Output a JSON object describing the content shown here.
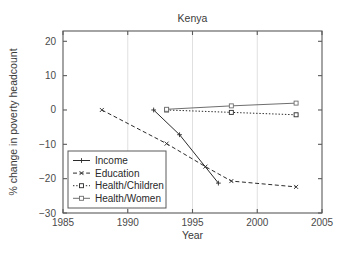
{
  "chart_data": {
    "type": "line",
    "title": "Kenya",
    "xlabel": "Year",
    "ylabel": "% change in poverty headcount",
    "xlim": [
      1985,
      2005
    ],
    "ylim": [
      -30,
      23
    ],
    "xticks": [
      1985,
      1990,
      1995,
      2000,
      2005
    ],
    "yticks": [
      20,
      10,
      0,
      -10,
      -20,
      -30
    ],
    "xtick_labels": [
      "1985",
      "1990",
      "1995",
      "2000",
      "2005"
    ],
    "ytick_labels": [
      "20",
      "10",
      "0",
      "-10",
      "-20",
      "-30"
    ],
    "grid": true,
    "grid_axis": "x",
    "legend_position": "lower left",
    "series": [
      {
        "name": "Income",
        "linestyle": "solid",
        "color": "#2b2b2b",
        "marker": "plus",
        "x": [
          1992,
          1994,
          1997
        ],
        "y": [
          0.0,
          -7.2,
          -21.3
        ]
      },
      {
        "name": "Education",
        "linestyle": "dashed",
        "color": "#2b2b2b",
        "marker": "x",
        "x": [
          1988,
          1993,
          1996,
          1998,
          2003
        ],
        "y": [
          0.0,
          -9.8,
          -16.5,
          -20.7,
          -22.4
        ]
      },
      {
        "name": "Health/Children",
        "linestyle": "dotted",
        "color": "#2b2b2b",
        "marker": "square",
        "x": [
          1993,
          1998,
          2003
        ],
        "y": [
          0.0,
          -0.7,
          -1.4
        ]
      },
      {
        "name": "Health/Women",
        "linestyle": "solid",
        "color": "#6e6e6e",
        "marker": "square",
        "x": [
          1993,
          1998,
          2003
        ],
        "y": [
          0.2,
          1.2,
          2.0
        ]
      }
    ]
  },
  "legend": {
    "entries": [
      {
        "label": "Income"
      },
      {
        "label": "Education"
      },
      {
        "label": "Health/Children"
      },
      {
        "label": "Health/Women"
      }
    ]
  }
}
